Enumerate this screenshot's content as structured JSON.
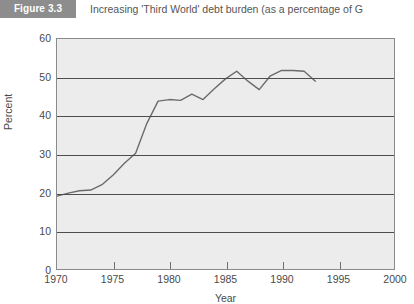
{
  "figure": {
    "badge_label": "Figure 3.3",
    "caption": "Increasing 'Third World' debt burden (as a percentage of G"
  },
  "chart_data": {
    "type": "line",
    "title": "Increasing 'Third World' debt burden (as a percentage of G",
    "xlabel": "Year",
    "ylabel": "Percent",
    "xlim": [
      1970,
      2000
    ],
    "ylim": [
      0,
      60
    ],
    "xticks": [
      1970,
      1975,
      1980,
      1985,
      1990,
      1995,
      2000
    ],
    "xtick_labels": [
      "1970",
      "1975",
      "1980",
      "1985",
      "1990",
      "1995",
      "2000"
    ],
    "yticks": [
      0,
      10,
      20,
      30,
      40,
      50,
      60
    ],
    "ytick_labels": [
      "0",
      "10",
      "20",
      "30",
      "40",
      "50",
      "60"
    ],
    "grid": "horizontal",
    "legend": "none",
    "series": [
      {
        "name": "Third World debt as percentage of GNP",
        "x": [
          1970,
          1971,
          1972,
          1973,
          1974,
          1975,
          1976,
          1977,
          1978,
          1979,
          1980,
          1981,
          1982,
          1983,
          1984,
          1985,
          1986,
          1987,
          1988,
          1989,
          1990,
          1991,
          1992,
          1993
        ],
        "values": [
          19.0,
          19.8,
          20.4,
          20.6,
          22.0,
          24.5,
          27.6,
          30.2,
          38.0,
          43.8,
          44.2,
          44.0,
          45.6,
          44.2,
          47.0,
          49.6,
          51.6,
          49.0,
          46.8,
          50.4,
          51.8,
          51.8,
          51.6,
          49.0
        ]
      }
    ]
  }
}
